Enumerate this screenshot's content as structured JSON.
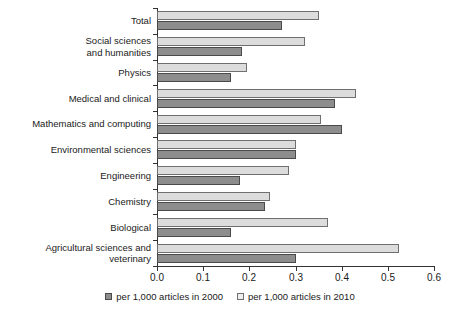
{
  "chart_data": {
    "type": "bar",
    "orientation": "horizontal",
    "title": "",
    "xlabel": "",
    "ylabel": "",
    "xlim": [
      0.0,
      0.6
    ],
    "xticks": [
      "0.0",
      "0.1",
      "0.2",
      "0.3",
      "0.4",
      "0.5",
      "0.6"
    ],
    "grid": false,
    "legend_position": "bottom-center",
    "categories": [
      "Total",
      "Social sciences\nand humanities",
      "Physics",
      "Medical and clinical",
      "Mathematics and computing",
      "Environmental sciences",
      "Engineering",
      "Chemistry",
      "Biological",
      "Agricultural sciences and\nveterinary"
    ],
    "series": [
      {
        "name": "per 1,000 articles in 2010",
        "color": "#dcdcdc",
        "values": [
          0.35,
          0.32,
          0.195,
          0.43,
          0.355,
          0.3,
          0.285,
          0.245,
          0.37,
          0.525
        ]
      },
      {
        "name": "per 1,000 articles in 2000",
        "color": "#8d8d8d",
        "values": [
          0.27,
          0.185,
          0.16,
          0.385,
          0.4,
          0.3,
          0.18,
          0.235,
          0.16,
          0.3
        ]
      }
    ]
  },
  "legend": {
    "items": [
      {
        "label": "per 1,000 articles in 2000",
        "swatch": "dark"
      },
      {
        "label": "per 1,000 articles in 2010",
        "swatch": "light"
      }
    ]
  }
}
